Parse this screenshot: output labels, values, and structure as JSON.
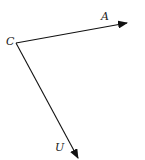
{
  "diagram": {
    "type": "vector-diagram",
    "points": {
      "C": {
        "label": "C",
        "x": 16,
        "y": 43
      },
      "A": {
        "label": "A",
        "x": 127,
        "y": 23
      },
      "U": {
        "label": "U",
        "x": 78,
        "y": 158
      }
    },
    "vectors": [
      {
        "from": "C",
        "to": "A",
        "label": "A"
      },
      {
        "from": "C",
        "to": "U",
        "label": "U"
      }
    ],
    "colors": {
      "stroke": "#111111",
      "background": "#ffffff",
      "text": "#222222"
    }
  }
}
